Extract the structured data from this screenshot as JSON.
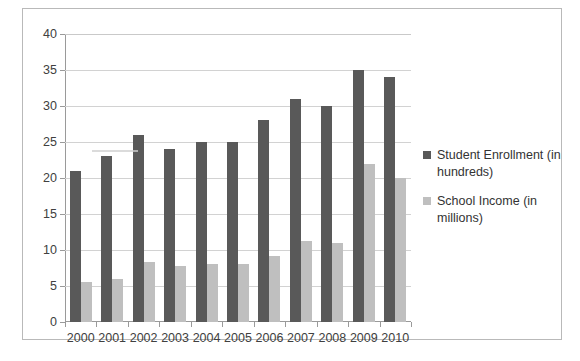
{
  "chart_data": {
    "type": "bar",
    "title": "",
    "xlabel": "",
    "ylabel": "",
    "categories": [
      "2000",
      "2001",
      "2002",
      "2003",
      "2004",
      "2005",
      "2006",
      "2007",
      "2008",
      "2009",
      "2010"
    ],
    "series": [
      {
        "name": "Student Enrollment (in hundreds)",
        "color": "#595959",
        "values": [
          21,
          23,
          26,
          24,
          25,
          25,
          28,
          31,
          30,
          35,
          34
        ]
      },
      {
        "name": "School Income (in millions)",
        "color": "#bfbfbf",
        "values": [
          5.6,
          6,
          8.3,
          7.8,
          8,
          8,
          9.2,
          11.3,
          11,
          22,
          20
        ]
      }
    ],
    "ylim": [
      0,
      40
    ],
    "ytick_labels": [
      "0",
      "5",
      "10",
      "15",
      "20",
      "25",
      "30",
      "35",
      "40"
    ],
    "ytick_values": [
      0,
      5,
      10,
      15,
      20,
      25,
      30,
      35,
      40
    ],
    "grid": true,
    "legend_position": "right"
  },
  "legend": {
    "entries": [
      {
        "label": "Student Enrollment (in hundreds)",
        "marker": "square-marker-dark"
      },
      {
        "label": "School Income (in millions)",
        "marker": "square-marker-light"
      }
    ]
  }
}
